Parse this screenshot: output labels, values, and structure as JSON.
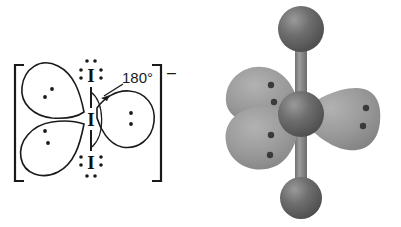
{
  "figure": {
    "background": "#ffffff",
    "line_color": "#1a1a1a"
  },
  "lewis": {
    "panel_name": "lewis-structure-panel",
    "charge_label": "–",
    "angle_label": "180°",
    "atoms": [
      {
        "id": "top-iodine",
        "symbol": "I",
        "x": 91,
        "y": 76,
        "lone_pairs": [
          "top",
          "left",
          "right"
        ]
      },
      {
        "id": "central-iodine",
        "symbol": "I",
        "x": 91,
        "y": 119,
        "lone_pairs": []
      },
      {
        "id": "bottom-iodine",
        "symbol": "I",
        "x": 91,
        "y": 163,
        "lone_pairs": [
          "left",
          "right",
          "bottom"
        ]
      }
    ],
    "bonds": [
      {
        "id": "top-bond",
        "style": "vertical-line",
        "x": 91,
        "y1": 86,
        "y2": 110
      },
      {
        "id": "bottom-bond",
        "style": "vertical-line",
        "x": 91,
        "y1": 129,
        "y2": 153
      }
    ],
    "lobes": [
      {
        "id": "upper-left-lobe",
        "dots": 2
      },
      {
        "id": "lower-left-lobe",
        "dots": 2
      },
      {
        "id": "right-lobe",
        "dots": 2
      }
    ],
    "bracket": {
      "id": "anion-bracket",
      "left_x": 14,
      "right_x": 160,
      "top_y": 64,
      "bottom_y": 182
    }
  },
  "model": {
    "panel_name": "three-d-model-panel",
    "colors": {
      "sphere": "#6a6a6a",
      "sphere_dark": "#4a4a4a",
      "sphere_highlight": "#8e8e8e",
      "lobe": "#9b9b9b",
      "lobe_dark": "#7d7d7d",
      "bond": "#7a7a7a",
      "dot": "#3a3a3a"
    },
    "spheres": [
      {
        "id": "top-iodine-sphere",
        "cx": 100,
        "cy": 28,
        "r": 22
      },
      {
        "id": "central-iodine-sphere",
        "cx": 101,
        "cy": 114,
        "r": 22
      },
      {
        "id": "bottom-iodine-sphere",
        "cx": 100,
        "cy": 197,
        "r": 20
      }
    ],
    "bonds": [
      {
        "id": "top-bond-rod",
        "x": 101,
        "y1": 28,
        "y2": 114,
        "width": 11
      },
      {
        "id": "bottom-bond-rod",
        "x": 101,
        "y1": 114,
        "y2": 197,
        "width": 11
      }
    ],
    "lobes": [
      {
        "id": "upper-left-lobe-3d",
        "cx": 64,
        "cy": 85,
        "dots": 2
      },
      {
        "id": "lower-left-lobe-3d",
        "cx": 64,
        "cy": 143,
        "dots": 2
      },
      {
        "id": "right-lobe-3d",
        "cx": 152,
        "cy": 117,
        "dots": 2
      }
    ]
  }
}
